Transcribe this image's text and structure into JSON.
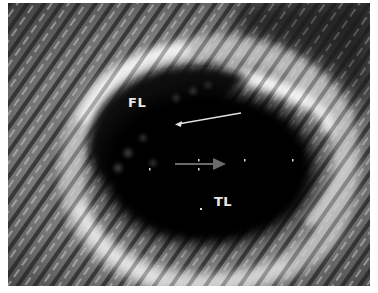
{
  "image": {
    "description": "Intravascular ultrasound cross-section showing aortic dissection with false lumen and true lumen",
    "labels": {
      "false_lumen": "FL",
      "true_lumen": "TL"
    },
    "annotations": {
      "white_arrow": "points to intimal flap separating false lumen",
      "gray_arrow": "catheter direction marker at center"
    },
    "scale_ticks_count": 5,
    "colors": {
      "background": "#1a1a1a",
      "lumen": "#050505",
      "tissue_bright": "#f2f2f2",
      "tissue_mid": "#8a8a8a",
      "border": "#ffffff"
    }
  }
}
